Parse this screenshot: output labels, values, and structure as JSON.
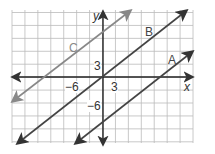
{
  "chart_data": {
    "type": "line",
    "title": "",
    "xlabel": "x",
    "ylabel": "y",
    "tick_labels": {
      "x": [
        "-6",
        "3"
      ],
      "y": [
        "3",
        "-6"
      ]
    },
    "grid": true,
    "grid_unit": 3,
    "series": [
      {
        "name": "A",
        "color": "#444444",
        "x1": 75,
        "y1": 143,
        "x2": 192,
        "y2": 52
      },
      {
        "name": "B",
        "color": "#444444",
        "x1": 18,
        "y1": 143,
        "x2": 186,
        "y2": 11
      },
      {
        "name": "C",
        "color": "#888888",
        "x1": 12,
        "y1": 101,
        "x2": 130,
        "y2": 11
      }
    ]
  },
  "labels": {
    "y_axis": "y",
    "x_axis": "x",
    "tick_x_neg6": "−6",
    "tick_x_3": "3",
    "tick_y_3": "3",
    "tick_y_neg6": "−6",
    "line_a": "A",
    "line_b": "B",
    "line_c": "C"
  }
}
